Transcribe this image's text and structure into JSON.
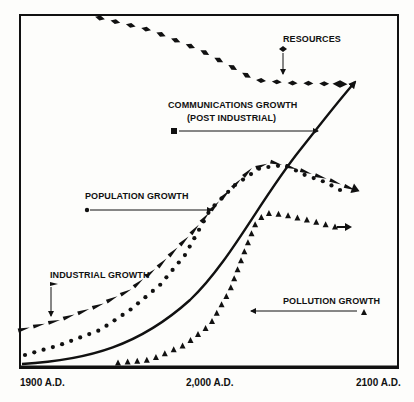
{
  "chart_data": {
    "type": "line",
    "title": "",
    "xlabel": "",
    "ylabel": "",
    "x_ticks": [
      "1900 A.D.",
      "2,000 A.D.",
      "2100 A.D."
    ],
    "xlim": [
      1900,
      2100
    ],
    "ylim": [
      0,
      100
    ],
    "grid": false,
    "legend_position": "inline annotations",
    "series": [
      {
        "name": "RESOURCES",
        "marker": "diamond",
        "x": [
          1940,
          1960,
          1980,
          2000,
          2020,
          2040,
          2060,
          2080
        ],
        "values": [
          100,
          98,
          95,
          90,
          83,
          77,
          76,
          76
        ]
      },
      {
        "name": "COMMUNICATIONS GROWTH (POST INDUSTRIAL)",
        "marker": "solid-line-arrow",
        "x": [
          1900,
          1940,
          1980,
          2000,
          2020,
          2040,
          2060,
          2080
        ],
        "values": [
          0,
          3,
          13,
          25,
          42,
          57,
          68,
          78
        ]
      },
      {
        "name": "POPULATION GROWTH",
        "marker": "dot",
        "x": [
          1900,
          1920,
          1940,
          1960,
          1980,
          2000,
          2020,
          2040,
          2060,
          2075
        ],
        "values": [
          6,
          10,
          15,
          21,
          31,
          45,
          56,
          59,
          52,
          48
        ]
      },
      {
        "name": "INDUSTRIAL GROWTH",
        "marker": "dash-triangle",
        "x": [
          1900,
          1920,
          1940,
          1960,
          1980,
          2000,
          2020,
          2040,
          2060,
          2080
        ],
        "values": [
          11,
          14,
          17,
          22,
          31,
          44,
          56,
          60,
          56,
          50
        ]
      },
      {
        "name": "POLLUTION GROWTH",
        "marker": "triangle",
        "x": [
          1950,
          1970,
          1990,
          2010,
          2020,
          2030,
          2040,
          2060,
          2080
        ],
        "values": [
          0,
          2,
          8,
          22,
          36,
          44,
          45,
          42,
          40
        ]
      }
    ],
    "annotations": [
      {
        "text": "RESOURCES",
        "marker": "diamond",
        "pointer": "down-arrow"
      },
      {
        "text": "COMMUNICATIONS GROWTH",
        "subtext": "(POST INDUSTRIAL)",
        "marker": "square",
        "pointer": "right-arrow"
      },
      {
        "text": "POPULATION GROWTH",
        "marker": "dot",
        "pointer": "right-arrow"
      },
      {
        "text": "INDUSTRIAL GROWTH",
        "marker": "dash-triangle",
        "pointer": "down-arrow"
      },
      {
        "text": "POLLUTION GROWTH",
        "marker": "triangle",
        "pointer": "left-arrow"
      }
    ]
  },
  "labels": {
    "resources": "RESOURCES",
    "communications_1": "COMMUNICATIONS GROWTH",
    "communications_2": "(POST INDUSTRIAL)",
    "population": "POPULATION GROWTH",
    "industrial": "INDUSTRIAL GROWTH",
    "pollution": "POLLUTION GROWTH"
  },
  "axis": {
    "x_start": "1900 A.D.",
    "x_mid": "2,000 A.D.",
    "x_end": "2100 A.D."
  }
}
